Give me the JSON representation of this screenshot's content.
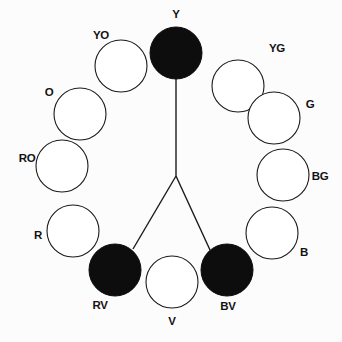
{
  "diagram": {
    "type": "color-wheel",
    "background_color": "#fcfcfc",
    "stroke_color": "#1a1a1a",
    "fill_selected_color": "#0d0d0d",
    "fill_unselected_color": "#ffffff",
    "center": {
      "x": 176,
      "y": 176
    },
    "wheel_radius": 124,
    "swatch_radius": 26,
    "harmony_vertex": {
      "x": 176,
      "y": 176
    },
    "selected_hues": [
      "Y",
      "RV",
      "BV"
    ],
    "hues": [
      {
        "code": "Y",
        "name": "yellow",
        "angle_deg": -90,
        "cx": 176,
        "cy": 53,
        "selected": true,
        "label_x": 176,
        "label_y": 15,
        "label_anchor": "top"
      },
      {
        "code": "YG",
        "name": "yellow-green",
        "angle_deg": -60,
        "cx": 238,
        "cy": 86,
        "selected": false,
        "label_x": 277,
        "label_y": 49,
        "label_anchor": "upper-right"
      },
      {
        "code": "G",
        "name": "green",
        "angle_deg": -30,
        "cx": 274,
        "cy": 118,
        "selected": false,
        "label_x": 310,
        "label_y": 105,
        "label_anchor": "right"
      },
      {
        "code": "BG",
        "name": "blue-green",
        "angle_deg": 0,
        "cx": 283,
        "cy": 175,
        "selected": false,
        "label_x": 320,
        "label_y": 177,
        "label_anchor": "right"
      },
      {
        "code": "B",
        "name": "blue",
        "angle_deg": 30,
        "cx": 272,
        "cy": 233,
        "selected": false,
        "label_x": 304,
        "label_y": 253,
        "label_anchor": "lower-right"
      },
      {
        "code": "BV",
        "name": "blue-violet",
        "angle_deg": 60,
        "cx": 227,
        "cy": 270,
        "selected": true,
        "label_x": 228,
        "label_y": 307,
        "label_anchor": "bottom"
      },
      {
        "code": "V",
        "name": "violet",
        "angle_deg": 90,
        "cx": 172,
        "cy": 282,
        "selected": false,
        "label_x": 172,
        "label_y": 322,
        "label_anchor": "bottom"
      },
      {
        "code": "RV",
        "name": "red-violet",
        "angle_deg": 120,
        "cx": 115,
        "cy": 270,
        "selected": true,
        "label_x": 100,
        "label_y": 306,
        "label_anchor": "bottom"
      },
      {
        "code": "R",
        "name": "red",
        "angle_deg": 150,
        "cx": 73,
        "cy": 231,
        "selected": false,
        "label_x": 38,
        "label_y": 236,
        "label_anchor": "left"
      },
      {
        "code": "RO",
        "name": "red-orange",
        "angle_deg": 180,
        "cx": 62,
        "cy": 166,
        "selected": false,
        "label_x": 27,
        "label_y": 159,
        "label_anchor": "left"
      },
      {
        "code": "O",
        "name": "orange",
        "angle_deg": -150,
        "cx": 80,
        "cy": 114,
        "selected": false,
        "label_x": 49,
        "label_y": 93,
        "label_anchor": "upper-left"
      },
      {
        "code": "YO",
        "name": "yellow-orange",
        "angle_deg": -120,
        "cx": 121,
        "cy": 66,
        "selected": false,
        "label_x": 101,
        "label_y": 36,
        "label_anchor": "upper-left"
      }
    ],
    "harmony_lines": [
      {
        "name": "line-to-yellow",
        "from_x": 176,
        "from_y": 176,
        "to_x": 176,
        "to_y": 78
      },
      {
        "name": "line-to-red-violet",
        "from_x": 176,
        "from_y": 176,
        "to_x": 133,
        "to_y": 249
      },
      {
        "name": "line-to-blue-violet",
        "from_x": 176,
        "from_y": 176,
        "to_x": 210,
        "to_y": 250
      }
    ]
  }
}
